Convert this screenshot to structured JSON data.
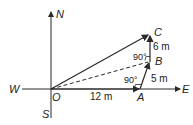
{
  "diagram": {
    "compass": {
      "north": "N",
      "south": "S",
      "east": "E",
      "west": "W"
    },
    "points": {
      "origin": "O",
      "a": "A",
      "b": "B",
      "c": "C"
    },
    "measurements": {
      "oa": "12 m",
      "ab": "5 m",
      "bc": "6 m"
    },
    "angles": {
      "at_a": "90°",
      "at_b": "90°"
    },
    "colors": {
      "line": "#2a2a2a",
      "background": "#ffffff"
    }
  }
}
